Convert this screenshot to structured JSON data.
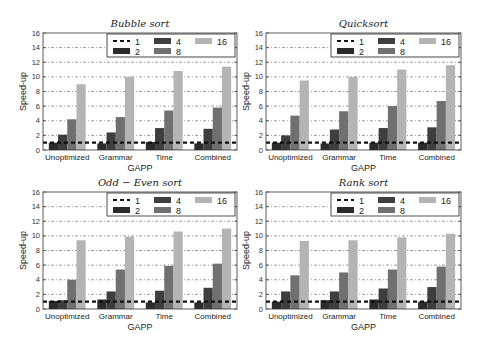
{
  "figure": {
    "series_colors": {
      "1": "#111111",
      "2": "#2b2b2b",
      "4": "#3e3e3e",
      "8": "#707070",
      "16": "#b4b4b4"
    },
    "grid_color": "#555555",
    "frame_color": "#333333"
  },
  "chart_data": [
    {
      "type": "bar",
      "title": "Bubble sort",
      "xlabel": "GAPP",
      "ylabel": "Speed-up",
      "ylim": [
        0,
        16
      ],
      "yticks": [
        "0",
        "2",
        "4",
        "6",
        "8",
        "10",
        "12",
        "14",
        "16"
      ],
      "grid": true,
      "legend_position": "top-right",
      "categories": [
        "Unoptimized",
        "Grammar",
        "Time",
        "Combined"
      ],
      "baseline": {
        "name": "1",
        "value": 1.0,
        "style": "dashed"
      },
      "series": [
        {
          "name": "2",
          "values": [
            1.0,
            0.9,
            1.1,
            0.9
          ]
        },
        {
          "name": "4",
          "values": [
            2.1,
            2.4,
            3.0,
            2.9
          ]
        },
        {
          "name": "8",
          "values": [
            4.2,
            4.5,
            5.4,
            5.8
          ]
        },
        {
          "name": "16",
          "values": [
            9.0,
            10.0,
            10.8,
            11.4
          ]
        }
      ]
    },
    {
      "type": "bar",
      "title": "Quicksort",
      "xlabel": "GAPP",
      "ylabel": "Speed-up",
      "ylim": [
        0,
        16
      ],
      "yticks": [
        "0",
        "2",
        "4",
        "6",
        "8",
        "10",
        "12",
        "14",
        "16"
      ],
      "grid": true,
      "legend_position": "top-right",
      "categories": [
        "Unoptimized",
        "Grammar",
        "Time",
        "Combined"
      ],
      "baseline": {
        "name": "1",
        "value": 1.0,
        "style": "dashed"
      },
      "series": [
        {
          "name": "2",
          "values": [
            1.0,
            0.9,
            1.0,
            1.0
          ]
        },
        {
          "name": "4",
          "values": [
            2.0,
            2.8,
            3.0,
            3.1
          ]
        },
        {
          "name": "8",
          "values": [
            4.7,
            5.3,
            6.0,
            6.7
          ]
        },
        {
          "name": "16",
          "values": [
            9.5,
            10.0,
            11.0,
            11.6
          ]
        }
      ]
    },
    {
      "type": "bar",
      "title": "Odd − Even sort",
      "xlabel": "GAPP",
      "ylabel": "Speed-up",
      "ylim": [
        0,
        16
      ],
      "yticks": [
        "0",
        "2",
        "4",
        "6",
        "8",
        "10",
        "12",
        "14",
        "16"
      ],
      "grid": true,
      "legend_position": "top-right",
      "categories": [
        "Unoptimized",
        "Grammar",
        "Time",
        "Combined"
      ],
      "baseline": {
        "name": "1",
        "value": 1.0,
        "style": "dashed"
      },
      "series": [
        {
          "name": "2",
          "values": [
            1.1,
            1.3,
            0.9,
            0.9
          ]
        },
        {
          "name": "4",
          "values": [
            1.2,
            2.4,
            2.5,
            2.9
          ]
        },
        {
          "name": "8",
          "values": [
            4.0,
            5.4,
            5.9,
            6.2
          ]
        },
        {
          "name": "16",
          "values": [
            9.4,
            9.9,
            10.6,
            11.0
          ]
        }
      ]
    },
    {
      "type": "bar",
      "title": "Rank sort",
      "xlabel": "GAPP",
      "ylabel": "Speed-up",
      "ylim": [
        0,
        16
      ],
      "yticks": [
        "0",
        "2",
        "4",
        "6",
        "8",
        "10",
        "12",
        "14",
        "16"
      ],
      "grid": true,
      "legend_position": "top-right",
      "categories": [
        "Unoptimized",
        "Grammar",
        "Time",
        "Combined"
      ],
      "baseline": {
        "name": "1",
        "value": 1.0,
        "style": "dashed"
      },
      "series": [
        {
          "name": "2",
          "values": [
            1.0,
            1.2,
            1.3,
            1.0
          ]
        },
        {
          "name": "4",
          "values": [
            2.4,
            2.4,
            2.8,
            3.0
          ]
        },
        {
          "name": "8",
          "values": [
            4.6,
            5.0,
            5.4,
            5.8
          ]
        },
        {
          "name": "16",
          "values": [
            9.3,
            9.4,
            9.8,
            10.3
          ]
        }
      ]
    }
  ]
}
